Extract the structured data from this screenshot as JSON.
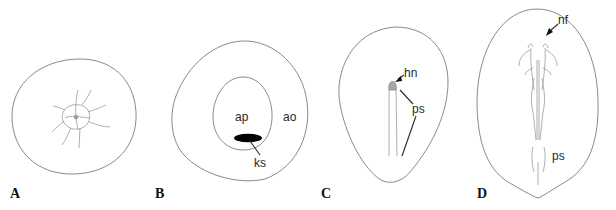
{
  "figure": {
    "panels": [
      {
        "id": "A",
        "letter": "A",
        "labels": []
      },
      {
        "id": "B",
        "letter": "B",
        "labels": [
          {
            "key": "ap",
            "text": "ap"
          },
          {
            "key": "ao",
            "text": "ao"
          },
          {
            "key": "ks",
            "text": "ks"
          }
        ]
      },
      {
        "id": "C",
        "letter": "C",
        "labels": [
          {
            "key": "hn",
            "text": "hn"
          },
          {
            "key": "ps",
            "text": "ps"
          }
        ]
      },
      {
        "id": "D",
        "letter": "D",
        "labels": [
          {
            "key": "nf",
            "text": "nf"
          },
          {
            "key": "ps",
            "text": "ps"
          }
        ]
      }
    ]
  },
  "colors": {
    "outline": "#8a8a8a",
    "fill_dark": "#000000",
    "tip_gray": "#9a9a9a",
    "text": "#2a2a2a"
  }
}
